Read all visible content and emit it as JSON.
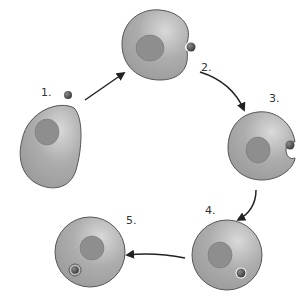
{
  "diagram": {
    "type": "cycle",
    "steps": [
      {
        "label": "1.",
        "state": "particle approaches cell"
      },
      {
        "label": "2.",
        "state": "particle contacts cell membrane"
      },
      {
        "label": "3.",
        "state": "membrane invaginates around particle"
      },
      {
        "label": "4.",
        "state": "membrane closes around particle"
      },
      {
        "label": "5.",
        "state": "particle enclosed in vesicle inside cell"
      }
    ]
  },
  "colors": {
    "cell_fill": "#a9a9a9",
    "cell_highlight": "#d6d6d6",
    "nucleus": "#8e8e8e",
    "outline": "#555555",
    "particle": "#5a5a5a",
    "arrow": "#222222"
  }
}
